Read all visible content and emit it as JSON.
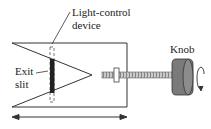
{
  "diagram": {
    "labels": {
      "light_control_line1": "Light-control",
      "light_control_line2": "device",
      "exit_slit_line1": "Exit",
      "exit_slit_line2": "slit",
      "knob": "Knob"
    },
    "colors": {
      "line": "#333333",
      "slit_bar": "#222222",
      "knob_body": "#7a7a7a",
      "knob_face": "#9a9a9a",
      "screw": "#888888"
    }
  }
}
